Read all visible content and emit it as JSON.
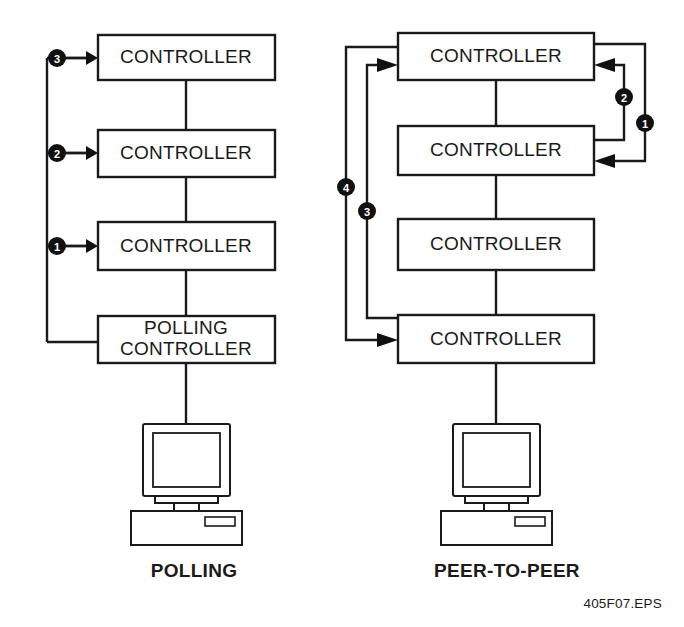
{
  "figure": {
    "file_label": "405F07.EPS",
    "background_color": "#ffffff",
    "line_color": "#1a1a1a",
    "bullet_color": "#111111"
  },
  "diagrams": [
    {
      "id": "polling",
      "caption": "POLLING",
      "nodes": [
        {
          "label": "CONTROLLER"
        },
        {
          "label": "CONTROLLER"
        },
        {
          "label": "CONTROLLER"
        },
        {
          "label_line1": "POLLING",
          "label_line2": "CONTROLLER"
        }
      ],
      "bullets": [
        {
          "number": "3"
        },
        {
          "number": "2"
        },
        {
          "number": "1"
        }
      ],
      "workstation": {
        "icon": "desktop-computer-icon"
      }
    },
    {
      "id": "peer-to-peer",
      "caption": "PEER-TO-PEER",
      "nodes": [
        {
          "label": "CONTROLLER"
        },
        {
          "label": "CONTROLLER"
        },
        {
          "label": "CONTROLLER"
        },
        {
          "label": "CONTROLLER"
        }
      ],
      "bullets": [
        {
          "number": "2"
        },
        {
          "number": "1"
        },
        {
          "number": "4"
        },
        {
          "number": "3"
        }
      ],
      "workstation": {
        "icon": "desktop-computer-icon"
      }
    }
  ]
}
